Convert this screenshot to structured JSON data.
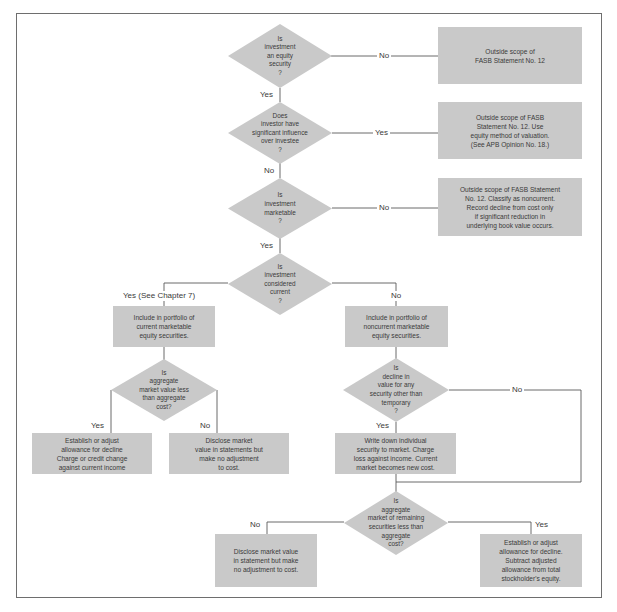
{
  "diagram": {
    "colors": {
      "shape_fill": "#c9c9c9",
      "line": "#5a5a5a",
      "text": "#3a3a3a",
      "background": "#ffffff"
    },
    "decisions": {
      "d1": "Is\ninvestment\nan equity\nsecurity\n?",
      "d2": "Does\ninvestor have\nsignificant influence\nover investee\n?",
      "d3": "Is\ninvestment\nmarketable\n?",
      "d4": "Is\ninvestment\nconsidered\ncurrent\n?",
      "d5": "Is\naggregate\nmarket value less\nthan aggregate\ncost?",
      "d6": "Is\ndecline in\nvalue for any\nsecurity other than\ntemporary\n?",
      "d7": "Is\naggregate\nmarket of remaining\nsecurities less than\naggregate\ncost?"
    },
    "actions": {
      "a1": "Outside scope of\nFASB Statement No. 12",
      "a2": "Outside scope of FASB\nStatement No. 12. Use\nequity method of valuation.\n(See APB Opinion No. 18.)",
      "a3": "Outside scope of FASB Statement\nNo. 12. Classify as noncurrent.\nRecord decline from cost only\nif significant reduction in\nunderlying book value occurs.",
      "a4": "Include in portfolio of\ncurrent marketable\nequity securities.",
      "a5": "Include in portfolio of\nnoncurrent marketable\nequity securities.",
      "a6": "Establish or adjust\nallowance for decline\nCharge or credit change\nagainst current income",
      "a7": "Disclose market\nvalue in statements but\nmake no adjustment\nto cost.",
      "a8": "Write down individual\nsecurity to market. Charge\nloss against income. Current\nmarket becomes new cost.",
      "a9": "Disclose market value\nin statement but make\nno adjustment to cost.",
      "a10": "Establish or adjust\nallowance for decline.\nSubtract adjusted\nallowance from total\nstockholder's equity."
    },
    "edge_labels": {
      "d1_no": "No",
      "d1_yes": "Yes",
      "d2_yes": "Yes",
      "d2_no": "No",
      "d3_no": "No",
      "d3_yes": "Yes",
      "d4_yes": "Yes (See Chapter 7)",
      "d4_no": "No",
      "d5_yes": "Yes",
      "d5_no": "No",
      "d6_no": "No",
      "d6_yes": "Yes",
      "d7_no": "No",
      "d7_yes": "Yes"
    }
  }
}
